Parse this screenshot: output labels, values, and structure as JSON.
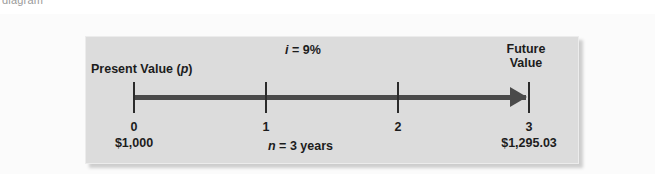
{
  "caption_fragment": "diagram",
  "figure": {
    "present_value": {
      "label_prefix": "Present Value (",
      "label_symbol": "p",
      "label_suffix": ")"
    },
    "interest_rate": {
      "symbol": "i",
      "equation": " = 9%",
      "value_percent": 9
    },
    "future_value": {
      "label": "Future Value"
    },
    "periods": {
      "symbol": "n",
      "equation": " = 3 years",
      "value": 3,
      "unit": "years"
    },
    "axis": {
      "arrow_direction": "right",
      "line_color": "#4a4a4a",
      "tick_color": "#2b2b2b"
    },
    "timeline": [
      {
        "period": "0",
        "amount": "$1,000"
      },
      {
        "period": "1",
        "amount": ""
      },
      {
        "period": "2",
        "amount": ""
      },
      {
        "period": "3",
        "amount": "$1,295.03"
      }
    ],
    "colors": {
      "panel_background": "#dcdcdc",
      "page_background": "#fbfbfb",
      "text": "#1c1c1c"
    }
  }
}
